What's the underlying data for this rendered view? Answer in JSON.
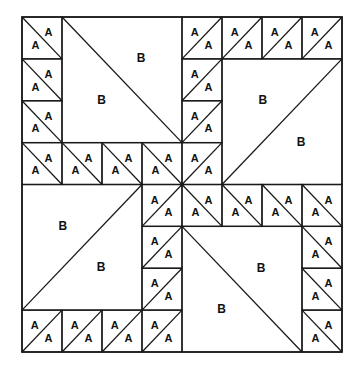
{
  "diagram": {
    "title": "",
    "grid": {
      "rows": 8,
      "cols": 8,
      "left": 22,
      "top": 17,
      "width": 320,
      "height": 335
    },
    "colors": {
      "line": "#1a1a1a",
      "text": "#111111",
      "background": "#ffffff"
    },
    "a_label": "A",
    "b_label": "B",
    "a_squares": [
      {
        "r": 0,
        "c": 0,
        "d": "\\"
      },
      {
        "r": 1,
        "c": 0,
        "d": "\\"
      },
      {
        "r": 2,
        "c": 0,
        "d": "\\"
      },
      {
        "r": 3,
        "c": 0,
        "d": "\\"
      },
      {
        "r": 3,
        "c": 1,
        "d": "\\"
      },
      {
        "r": 3,
        "c": 2,
        "d": "\\"
      },
      {
        "r": 3,
        "c": 3,
        "d": "\\"
      },
      {
        "r": 0,
        "c": 4,
        "d": "/"
      },
      {
        "r": 0,
        "c": 5,
        "d": "/"
      },
      {
        "r": 0,
        "c": 6,
        "d": "/"
      },
      {
        "r": 0,
        "c": 7,
        "d": "/"
      },
      {
        "r": 1,
        "c": 4,
        "d": "/"
      },
      {
        "r": 2,
        "c": 4,
        "d": "/"
      },
      {
        "r": 3,
        "c": 4,
        "d": "/"
      },
      {
        "r": 4,
        "c": 4,
        "d": "\\"
      },
      {
        "r": 4,
        "c": 5,
        "d": "\\"
      },
      {
        "r": 4,
        "c": 6,
        "d": "\\"
      },
      {
        "r": 4,
        "c": 7,
        "d": "\\"
      },
      {
        "r": 5,
        "c": 7,
        "d": "\\"
      },
      {
        "r": 6,
        "c": 7,
        "d": "\\"
      },
      {
        "r": 7,
        "c": 7,
        "d": "\\"
      },
      {
        "r": 4,
        "c": 3,
        "d": "/"
      },
      {
        "r": 5,
        "c": 3,
        "d": "/"
      },
      {
        "r": 6,
        "c": 3,
        "d": "/"
      },
      {
        "r": 7,
        "c": 3,
        "d": "/"
      },
      {
        "r": 7,
        "c": 0,
        "d": "/"
      },
      {
        "r": 7,
        "c": 1,
        "d": "/"
      },
      {
        "r": 7,
        "c": 2,
        "d": "/"
      }
    ],
    "b_blocks": [
      {
        "name": "top-left",
        "r": 0,
        "c": 1,
        "size": 3,
        "d": "\\"
      },
      {
        "name": "top-right",
        "r": 1,
        "c": 5,
        "size": 3,
        "d": "/"
      },
      {
        "name": "bottom-right",
        "r": 5,
        "c": 4,
        "size": 3,
        "d": "\\"
      },
      {
        "name": "bottom-left",
        "r": 4,
        "c": 0,
        "size": 3,
        "d": "/"
      }
    ]
  }
}
